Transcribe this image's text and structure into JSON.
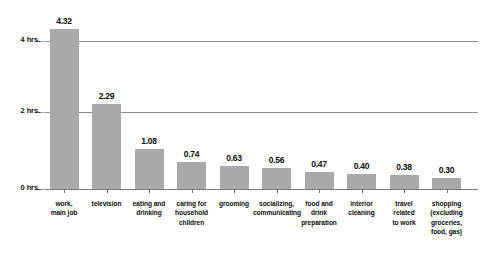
{
  "chart_data": {
    "type": "bar",
    "title": "",
    "subtitle": "",
    "xlabel": "",
    "ylabel": "",
    "ylim": [
      0,
      4.8
    ],
    "grid": true,
    "legend": false,
    "orientation": "vertical",
    "bar_color": "#a9a9a9",
    "gridline_color": "#8c8c8c",
    "value_label_format": "0.00",
    "y_ticks": [
      {
        "value": 4,
        "label": "4 hrs."
      },
      {
        "value": 2,
        "label": "2 hrs."
      },
      {
        "value": 0,
        "label": "0 hrs."
      }
    ],
    "categories": [
      "work, main job",
      "television",
      "eating and drinking",
      "caring for household children",
      "grooming",
      "socializing, communicating",
      "food and drink preparation",
      "interior cleaning",
      "travel related to work",
      "shopping (excluding groceries, food, gas)"
    ],
    "category_lines": [
      [
        "work,",
        "main job"
      ],
      [
        "television"
      ],
      [
        "eating and",
        "drinking"
      ],
      [
        "caring for",
        "household",
        "children"
      ],
      [
        "grooming"
      ],
      [
        "socializing,",
        "communicating"
      ],
      [
        "food and",
        "drink",
        "preparation"
      ],
      [
        "interior",
        "cleaning"
      ],
      [
        "travel",
        "related",
        "to work"
      ],
      [
        "shopping",
        "(excluding",
        "groceries,",
        "food, gas)"
      ]
    ],
    "values": [
      4.32,
      2.29,
      1.08,
      0.74,
      0.63,
      0.56,
      0.47,
      0.4,
      0.38,
      0.3
    ],
    "value_labels": [
      "4.32",
      "2.29",
      "1.08",
      "0.74",
      "0.63",
      "0.56",
      "0.47",
      "0.40",
      "0.38",
      "0.30"
    ]
  }
}
